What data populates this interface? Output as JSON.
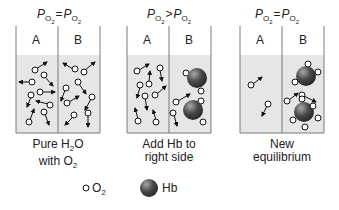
{
  "panels": [
    {
      "title": {
        "left_symbol": "P",
        "left_sub": "O2",
        "op": "=",
        "right_symbol": "P",
        "right_sub": "O2"
      },
      "label_a": "A",
      "label_b": "B",
      "caption_line1": "Pure H",
      "caption_line1_sub": "2",
      "caption_line1_end": "O",
      "caption_line2": "with O",
      "caption_line2_sub": "2"
    },
    {
      "title": {
        "left_symbol": "P",
        "left_sub": "O2",
        "op": ">",
        "right_symbol": "P",
        "right_sub": "O2"
      },
      "label_a": "A",
      "label_b": "B",
      "caption_line1": "Add Hb to",
      "caption_line2": "right side"
    },
    {
      "title": {
        "left_symbol": "P",
        "left_sub": "O2",
        "op": "=",
        "right_symbol": "P",
        "right_sub": "O2"
      },
      "label_a": "A",
      "label_b": "B",
      "caption_line1": "New",
      "caption_line2": "equilibrium"
    }
  ],
  "legend": {
    "o2_label": "O",
    "o2_sub": "2",
    "hb_label": "Hb"
  },
  "colors": {
    "liquid": "#e6e6e6",
    "border": "#7a7a7a",
    "hb_dark": "#3a3a3a",
    "hb_light": "#9a9a9a"
  }
}
